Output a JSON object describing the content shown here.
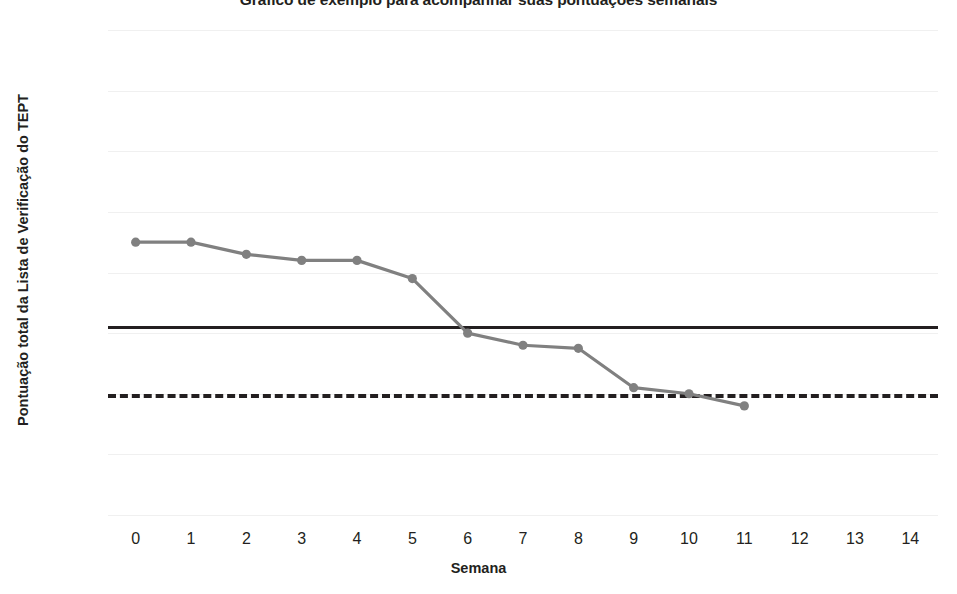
{
  "chart_data": {
    "type": "line",
    "title": "Gráfico de exemplo para acompanhar suas pontuações semanais",
    "xlabel": "Semana",
    "ylabel": "Pontuação total da Lista de Verificação do TEPT",
    "x": [
      0,
      1,
      2,
      3,
      4,
      5,
      6,
      7,
      8,
      9,
      10,
      11
    ],
    "values": [
      45,
      45,
      43,
      42,
      42,
      39,
      30,
      28,
      27.5,
      21,
      20,
      18
    ],
    "series": [
      {
        "name": "Pontuação total da Lista de Verificação do TEPT",
        "values": [
          45,
          45,
          43,
          42,
          42,
          39,
          30,
          28,
          27.5,
          21,
          20,
          18
        ],
        "color": "#808080",
        "marker": "circle"
      }
    ],
    "reference_lines": [
      {
        "name": "linha-de-corte-solida",
        "value": 31,
        "style": "solid",
        "color": "#231f20"
      },
      {
        "name": "linha-de-corte-tracejada",
        "value": 20,
        "style": "dashed",
        "color": "#231f20"
      }
    ],
    "xticks": [
      "0",
      "1",
      "2",
      "3",
      "4",
      "5",
      "6",
      "7",
      "8",
      "9",
      "10",
      "11",
      "12",
      "13",
      "14"
    ],
    "xtick_values": [
      0,
      1,
      2,
      3,
      4,
      5,
      6,
      7,
      8,
      9,
      10,
      11,
      12,
      13,
      14
    ],
    "yticks": [
      "0",
      "10",
      "20",
      "30",
      "40",
      "50",
      "60",
      "70",
      "80"
    ],
    "ytick_values": [
      0,
      10,
      20,
      30,
      40,
      50,
      60,
      70,
      80
    ],
    "xlim": [
      -0.5,
      14.5
    ],
    "ylim": [
      0,
      80
    ],
    "grid": true,
    "grid_axis": "y",
    "legend": "none",
    "background": "#ffffff"
  }
}
